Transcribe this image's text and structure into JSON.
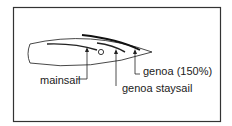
{
  "diagram": {
    "type": "sail-plan-top-view",
    "labels": {
      "mainsail": "mainsail",
      "genoa_staysail": "genoa staysail",
      "genoa": "genoa (150%)"
    },
    "colors": {
      "ink": "#222222",
      "background": "#ffffff"
    }
  }
}
